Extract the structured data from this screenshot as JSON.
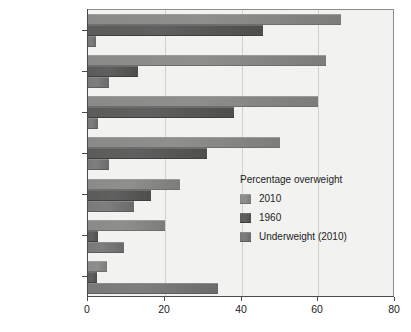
{
  "chart_data": {
    "type": "bar",
    "orientation": "horizontal",
    "title": "",
    "xlabel": "",
    "ylabel": "",
    "xlim": [
      0,
      80
    ],
    "xticks": [
      0,
      20,
      40,
      60,
      80
    ],
    "xticklabels": [
      "0",
      "20",
      "40",
      "60",
      "80"
    ],
    "grid": true,
    "categories": [
      "United States",
      "United Kingdom",
      "Canada",
      "France",
      "Japan",
      "China",
      "India"
    ],
    "series": [
      {
        "name": "2010",
        "color": "#8a8a88",
        "values": [
          66,
          62,
          60,
          50,
          24,
          20,
          5
        ]
      },
      {
        "name": "1960",
        "color": "#5b5b59",
        "values": [
          45.5,
          13,
          38,
          31,
          16.5,
          2.5,
          2.3
        ]
      },
      {
        "name": "Underweight (2010)",
        "color": "#79797a",
        "values": [
          2,
          5.5,
          2.5,
          5.5,
          12,
          9.5,
          34
        ]
      }
    ],
    "legend": {
      "position": "inside-right",
      "title": "Percentage overweight",
      "entries": [
        "2010",
        "1960",
        "Underweight (2010)"
      ]
    },
    "plot_background": "#f2f2f1",
    "axis_color": "#4a4a4a",
    "grid_color": "#d0d0cf"
  }
}
